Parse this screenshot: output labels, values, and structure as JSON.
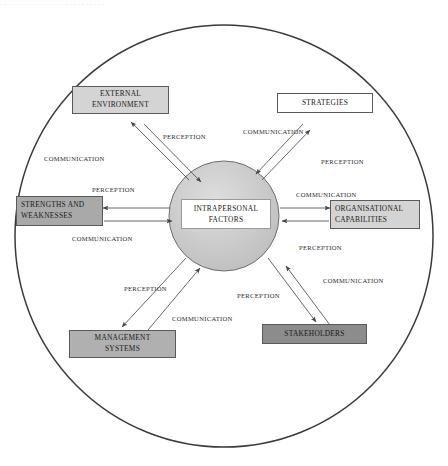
{
  "diagram": {
    "title_artifact": "- - - - - - - - - - - - - - - - - - - - - - - - - -",
    "outer_boundary_name": "organisational-boundary-ellipse",
    "center": {
      "label_line1": "INTRAPERSONAL",
      "label_line2": "FACTORS",
      "fill_color": "#c9c9c9"
    },
    "nodes": [
      {
        "id": "external-environment",
        "line1": "EXTERNAL",
        "line2": "ENVIRONMENT",
        "fill": "#d4d4d4",
        "align": "center"
      },
      {
        "id": "strategies",
        "line1": "STRATEGIES",
        "line2": "",
        "fill": "#ffffff",
        "align": "center"
      },
      {
        "id": "strengths-and-weaknesses",
        "line1": "STRENGTHS AND",
        "line2": "WEAKNESSES",
        "fill": "#a9a9a9",
        "align": "left"
      },
      {
        "id": "organisational-capabilities",
        "line1": "ORGANISATIONAL",
        "line2": "CAPABILITIES",
        "fill": "#d0d0d0",
        "align": "left"
      },
      {
        "id": "management-systems",
        "line1": "MANAGEMENT",
        "line2": "SYSTEMS",
        "fill": "#a0a0a0",
        "align": "center"
      },
      {
        "id": "stakeholders",
        "line1": "STAKEHOLDERS",
        "line2": "",
        "fill": "#8c8c8c",
        "align": "center"
      }
    ],
    "edge_labels": {
      "ee_perception": "PERCEPTION",
      "ee_communication": "COMMUNICATION",
      "st_communication": "COMMUNICATION",
      "st_perception": "PERCEPTION",
      "sw_perception": "PERCEPTION",
      "sw_communication": "COMMUNICATION",
      "oc_communication": "COMMUNICATION",
      "oc_perception": "PERCEPTION",
      "ms_perception": "PERCEPTION",
      "ms_communication": "COMMUNICATION",
      "sh_perception": "PERCEPTION",
      "sh_communication": "COMMUNICATION"
    },
    "colors": {
      "line": "#3a3a3a",
      "arrow": "#555555",
      "text": "#1a1a1a"
    }
  }
}
